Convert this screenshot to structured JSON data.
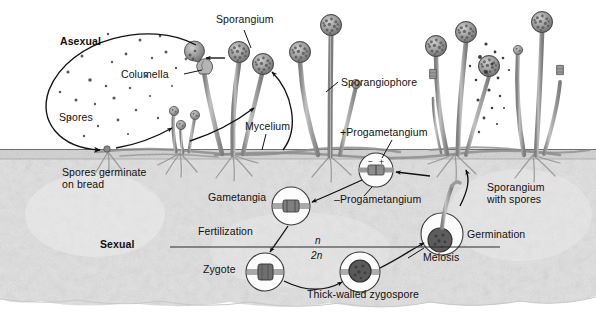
{
  "figure": {
    "domain": "Diagram",
    "width": 596,
    "height": 317,
    "background_color": "#ffffff",
    "ink_color": "#111111",
    "soil_color": "#d8d8d8",
    "stalk_color": "#9a9a9a",
    "spore_head_color": "#8c8c8c"
  },
  "labels": {
    "asexual": "Asexual",
    "sexual": "Sexual",
    "sporangium": "Sporangium",
    "columella": "Columella",
    "spores": "Spores",
    "spores_germinate": "Spores germinate\non bread",
    "mycelium": "Mycelium",
    "sporangiophore": "Sporangiophore",
    "plus_progametangium": "+Progametangium",
    "minus_progametangium": "–Progametangium",
    "gametangia": "Gametangia",
    "fertilization": "Fertilization",
    "zygote": "Zygote",
    "thick_walled_zygospore": "Thick-walled zygospore",
    "meiosis": "Meiosis",
    "germination": "Germination",
    "sporangium_with_spores": "Sporangium\nwith spores",
    "haploid_n": "n",
    "diploid_2n": "2n"
  },
  "label_positions": {
    "asexual": {
      "x": 60,
      "y": 36
    },
    "sporangium": {
      "x": 216,
      "y": 14
    },
    "columella": {
      "x": 121,
      "y": 69
    },
    "spores": {
      "x": 59,
      "y": 112
    },
    "sporangiophore": {
      "x": 341,
      "y": 77
    },
    "mycelium": {
      "x": 245,
      "y": 121
    },
    "plus_progametangium": {
      "x": 340,
      "y": 127
    },
    "spores_germinate": {
      "x": 62,
      "y": 167
    },
    "gametangia": {
      "x": 208,
      "y": 192
    },
    "minus_progametangium": {
      "x": 334,
      "y": 194
    },
    "sporangium_with_spores": {
      "x": 487,
      "y": 182
    },
    "fertilization": {
      "x": 198,
      "y": 226
    },
    "haploid_n": {
      "x": 315,
      "y": 236
    },
    "germination": {
      "x": 467,
      "y": 229
    },
    "sexual": {
      "x": 100,
      "y": 239
    },
    "diploid_2n": {
      "x": 311,
      "y": 250
    },
    "meiosis": {
      "x": 423,
      "y": 252
    },
    "zygote": {
      "x": 203,
      "y": 264
    },
    "thick_walled_zygospore": {
      "x": 307,
      "y": 289
    }
  },
  "structures": {
    "soil_surface_y": 149,
    "soil_bottom_y": 304,
    "mold_clusters": [
      {
        "name": "germinating-spore-cluster",
        "base_x": 107,
        "sporangiophores": 2
      },
      {
        "name": "young-mold-cluster",
        "base_x": 180,
        "sporangiophores": 3
      },
      {
        "name": "mature-mold-cluster-left",
        "base_x": 233,
        "sporangiophores": 3
      },
      {
        "name": "mature-mold-cluster-center",
        "base_x": 330,
        "sporangiophores": 3
      },
      {
        "name": "mature-mold-cluster-right-a",
        "base_x": 455,
        "sporangiophores": 3
      },
      {
        "name": "mature-mold-cluster-right-b",
        "base_x": 533,
        "sporangiophores": 3
      }
    ],
    "inset_circles": [
      {
        "name": "progametangium-inset",
        "cx": 376,
        "cy": 170,
        "r": 17,
        "content": "plus-minus-progametangia"
      },
      {
        "name": "gametangia-inset",
        "cx": 291,
        "cy": 206,
        "r": 19,
        "content": "fused-gametangia"
      },
      {
        "name": "zygote-inset",
        "cx": 265,
        "cy": 272,
        "r": 19,
        "content": "zygote"
      },
      {
        "name": "zygospore-inset",
        "cx": 360,
        "cy": 272,
        "r": 20,
        "content": "thick-walled-zygospore"
      },
      {
        "name": "germination-inset",
        "cx": 442,
        "cy": 234,
        "r": 21,
        "content": "germinating-zygospore"
      }
    ],
    "ploidy_line": {
      "x1": 170,
      "x2": 500,
      "y": 247
    }
  }
}
